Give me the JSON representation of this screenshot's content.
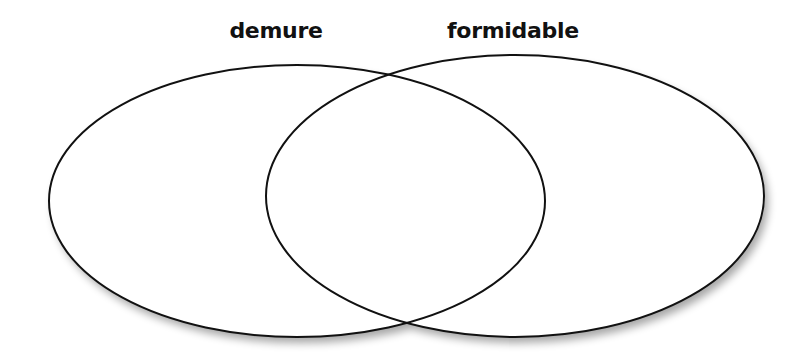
{
  "diagram": {
    "type": "venn",
    "sets": [
      {
        "label": "demure",
        "ellipse": {
          "cx": 297,
          "cy": 201,
          "rx": 248,
          "ry": 136
        }
      },
      {
        "label": "formidable",
        "ellipse": {
          "cx": 515,
          "cy": 196,
          "rx": 249,
          "ry": 141
        }
      }
    ],
    "colors": {
      "stroke": "#111111",
      "background": "#ffffff",
      "shadow": "#9a9a9a"
    }
  }
}
